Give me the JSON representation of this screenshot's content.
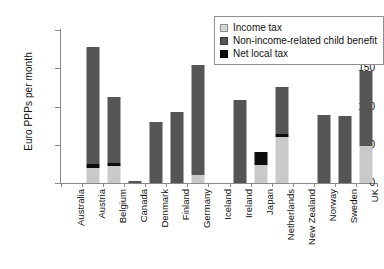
{
  "chart_data": {
    "type": "bar",
    "stacked": true,
    "title": "",
    "xlabel": "",
    "ylabel": "Euro PPPs per month",
    "ylim": [
      0,
      200
    ],
    "yticks": [
      0,
      50,
      100,
      150,
      200
    ],
    "ytick_labels": [
      "0",
      "50",
      "100",
      "150",
      "200"
    ],
    "grid": false,
    "legend_position": "top-right",
    "categories": [
      "Australia",
      "Austria",
      "Belgium",
      "Canada",
      "Denmark",
      "Finland",
      "Germany",
      "Iceland",
      "Ireland",
      "Japan",
      "Netherlands",
      "New Zealand",
      "Norway",
      "Sweden",
      "UK"
    ],
    "series": [
      {
        "name": "Income tax",
        "color": "#c9c9c9",
        "values": [
          0,
          20,
          22,
          0,
          0,
          0,
          10,
          0,
          0,
          24,
          60,
          0,
          0,
          0,
          48
        ]
      },
      {
        "name": "Non-income-related child benefit",
        "color": "#555555",
        "values": [
          0,
          153,
          86,
          3,
          80,
          93,
          144,
          0,
          109,
          0,
          62,
          0,
          89,
          88,
          99
        ]
      },
      {
        "name": "Net local tax",
        "color": "#0d0d0d",
        "values": [
          0,
          5,
          4,
          0,
          0,
          0,
          0,
          0,
          0,
          16,
          4,
          0,
          0,
          0,
          0
        ]
      }
    ],
    "totals": [
      0,
      178,
      112,
      3,
      80,
      93,
      154,
      0,
      109,
      40,
      126,
      0,
      89,
      88,
      147
    ]
  },
  "legend": {
    "items": [
      {
        "label": "Income tax",
        "swatch": "income-tax-swatch"
      },
      {
        "label": "Non-income-related child benefit",
        "swatch": "child-benefit-swatch"
      },
      {
        "label": "Net local tax",
        "swatch": "net-local-tax-swatch"
      }
    ]
  }
}
